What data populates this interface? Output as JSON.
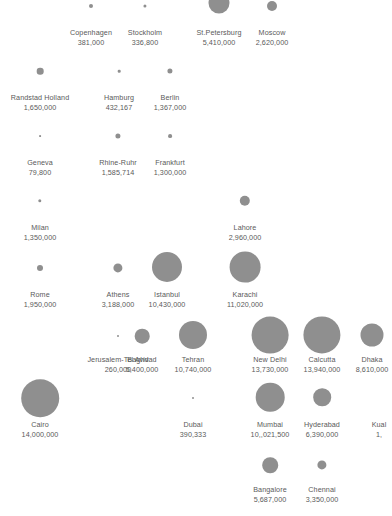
{
  "chart_data": {
    "type": "scatter",
    "title": "",
    "subtitle": "",
    "xlabel": "",
    "ylabel": "",
    "legend": "none",
    "grid": false,
    "bubble_color": "#8f8f8f",
    "label_color": "#5a5a5a",
    "background": "#ffffff",
    "encoding": "bubble area proportional to population value",
    "points": [
      {
        "name": "Copenhagen",
        "value": "381,000",
        "number": 381000,
        "x": 91,
        "y": 6,
        "r": 2.0,
        "label_x": 91,
        "label_y": 28
      },
      {
        "name": "Stockholm",
        "value": "336,800",
        "number": 336800,
        "x": 145,
        "y": 6,
        "r": 1.6,
        "label_x": 145,
        "label_y": 28
      },
      {
        "name": "St.Petersburg",
        "value": "5,410,000",
        "number": 5410000,
        "x": 219,
        "y": 3,
        "r": 10.5,
        "label_x": 219,
        "label_y": 28
      },
      {
        "name": "Moscow",
        "value": "2,620,000",
        "number": 2620000,
        "x": 272,
        "y": 6,
        "r": 5.0,
        "label_x": 272,
        "label_y": 28
      },
      {
        "name": "Randstad Holland",
        "value": "1,650,000",
        "number": 1650000,
        "x": 40,
        "y": 71,
        "r": 3.3,
        "label_x": 40,
        "label_y": 93
      },
      {
        "name": "Hamburg",
        "value": "432,167",
        "number": 432167,
        "x": 119,
        "y": 71,
        "r": 1.3,
        "label_x": 119,
        "label_y": 93
      },
      {
        "name": "Berlin",
        "value": "1,367,000",
        "number": 1367000,
        "x": 170,
        "y": 71,
        "r": 2.6,
        "label_x": 170,
        "label_y": 93
      },
      {
        "name": "Geneva",
        "value": "79,800",
        "number": 79800,
        "x": 40,
        "y": 136,
        "r": 0.9,
        "label_x": 40,
        "label_y": 158
      },
      {
        "name": "Rhine-Ruhr",
        "value": "1,585,714",
        "number": 1585714,
        "x": 118,
        "y": 136,
        "r": 2.6,
        "label_x": 118,
        "label_y": 158
      },
      {
        "name": "Frankfurt",
        "value": "1,300,000",
        "number": 1300000,
        "x": 170,
        "y": 136,
        "r": 1.9,
        "label_x": 170,
        "label_y": 158
      },
      {
        "name": "Milan",
        "value": "1,350,000",
        "number": 1350000,
        "x": 40,
        "y": 201,
        "r": 1.7,
        "label_x": 40,
        "label_y": 223
      },
      {
        "name": "Lahore",
        "value": "2,960,000",
        "number": 2960000,
        "x": 245,
        "y": 201,
        "r": 5.2,
        "label_x": 245,
        "label_y": 223
      },
      {
        "name": "Rome",
        "value": "1,950,000",
        "number": 1950000,
        "x": 40,
        "y": 268,
        "r": 3.0,
        "label_x": 40,
        "label_y": 290
      },
      {
        "name": "Athens",
        "value": "3,188,000",
        "number": 3188000,
        "x": 118,
        "y": 268,
        "r": 4.6,
        "label_x": 118,
        "label_y": 290
      },
      {
        "name": "Istanbul",
        "value": "10,430,000",
        "number": 10430000,
        "x": 167,
        "y": 267,
        "r": 15.0,
        "label_x": 167,
        "label_y": 290
      },
      {
        "name": "Karachi",
        "value": "11,020,000",
        "number": 11020000,
        "x": 245,
        "y": 267,
        "r": 15.4,
        "label_x": 245,
        "label_y": 290
      },
      {
        "name": "Jerusalem-Tel Aviv",
        "value": "260,000",
        "number": 260000,
        "x": 118,
        "y": 336,
        "r": 1.0,
        "label_x": 118,
        "label_y": 355
      },
      {
        "name": "Baghdad",
        "value": "5,400,000",
        "number": 5400000,
        "x": 142,
        "y": 336,
        "r": 7.3,
        "label_x": 142,
        "label_y": 355
      },
      {
        "name": "Tehran",
        "value": "10,740,000",
        "number": 10740000,
        "x": 193,
        "y": 335,
        "r": 14.0,
        "label_x": 193,
        "label_y": 355
      },
      {
        "name": "New Delhi",
        "value": "13,730,000",
        "number": 13730000,
        "x": 270,
        "y": 335,
        "r": 18.4,
        "label_x": 270,
        "label_y": 355
      },
      {
        "name": "Calcutta",
        "value": "13,940,000",
        "number": 13940000,
        "x": 322,
        "y": 335,
        "r": 18.6,
        "label_x": 322,
        "label_y": 355
      },
      {
        "name": "Dhaka",
        "value": "8,610,000",
        "number": 8610000,
        "x": 372,
        "y": 335,
        "r": 11.5,
        "label_x": 372,
        "label_y": 355
      },
      {
        "name": "Cairo",
        "value": "14,000,000",
        "number": 14000000,
        "x": 40,
        "y": 398,
        "r": 18.8,
        "label_x": 40,
        "label_y": 420
      },
      {
        "name": "Dubai",
        "value": "390,333",
        "number": 390333,
        "x": 193,
        "y": 398,
        "r": 1.0,
        "label_x": 193,
        "label_y": 420
      },
      {
        "name": "Mumbai",
        "value": "10,,021,500",
        "number": 10021500,
        "x": 270,
        "y": 397,
        "r": 14.3,
        "label_x": 270,
        "label_y": 420
      },
      {
        "name": "Hyderabad",
        "value": "6,390,000",
        "number": 6390000,
        "x": 322,
        "y": 397,
        "r": 8.8,
        "label_x": 322,
        "label_y": 420
      },
      {
        "name": "Kuala Lumpur",
        "value": "1,",
        "number": null,
        "x": 374,
        "y": 397,
        "r": 0.0,
        "label_x": 379,
        "label_y": 420,
        "truncated_name": "Kual"
      },
      {
        "name": "Bangalore",
        "value": "5,687,000",
        "number": 5687000,
        "x": 270,
        "y": 465,
        "r": 7.8,
        "label_x": 270,
        "label_y": 485
      },
      {
        "name": "Chennai",
        "value": "3,350,000",
        "number": 3350000,
        "x": 322,
        "y": 465,
        "r": 4.6,
        "label_x": 322,
        "label_y": 485
      }
    ]
  }
}
